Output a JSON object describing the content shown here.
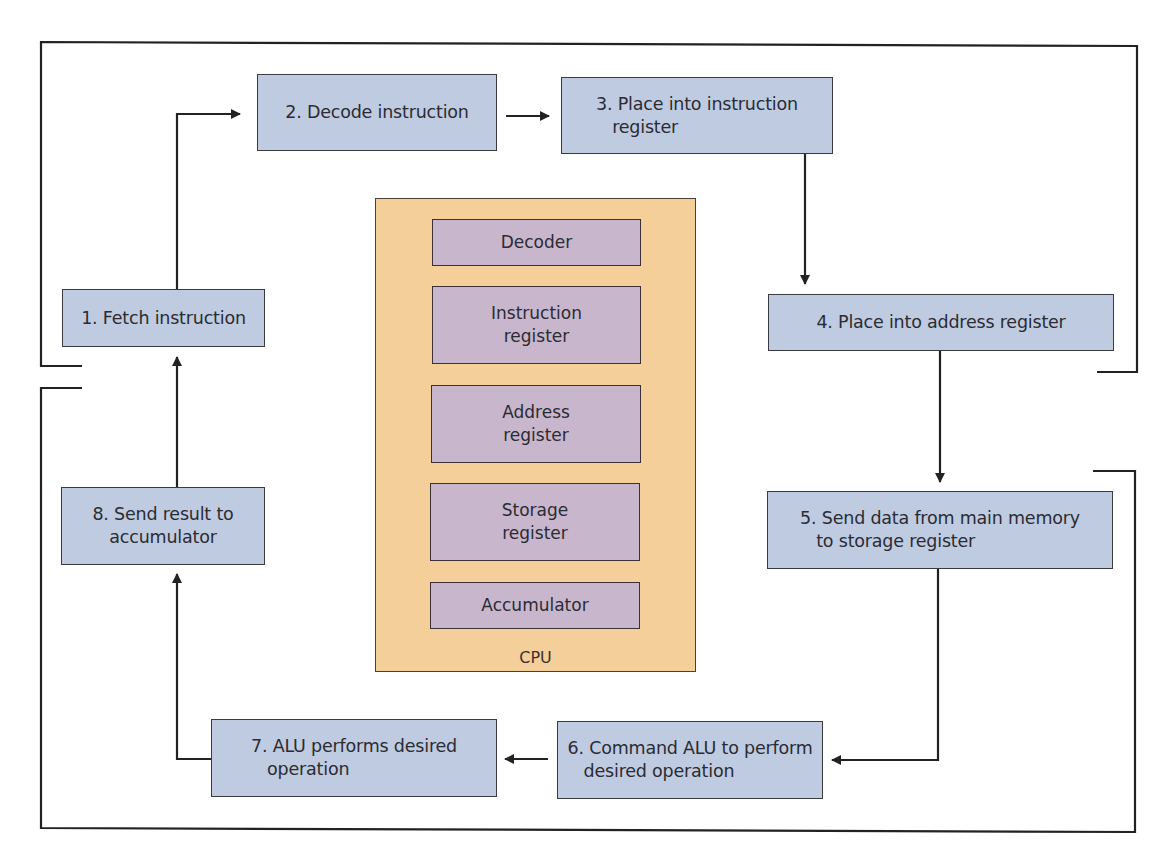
{
  "diagram": {
    "type": "flow-cycle",
    "colors": {
      "step_fill": "#bfcbe0",
      "cpu_fill": "#f5cf9a",
      "register_fill": "#c8b6cc",
      "line": "#222222",
      "background": "#ffffff"
    },
    "steps": [
      {
        "id": 1,
        "label": "1. Fetch instruction"
      },
      {
        "id": 2,
        "label": "2. Decode instruction"
      },
      {
        "id": 3,
        "label": "3. Place into instruction\n   register"
      },
      {
        "id": 4,
        "label": "4. Place into address register"
      },
      {
        "id": 5,
        "label": "5. Send data from main memory\n   to storage register"
      },
      {
        "id": 6,
        "label": "6. Command ALU to perform\n   desired operation"
      },
      {
        "id": 7,
        "label": "7. ALU performs desired\n   operation"
      },
      {
        "id": 8,
        "label": "8. Send result to\naccumulator"
      }
    ],
    "cpu": {
      "label": "CPU",
      "registers": [
        {
          "label": "Decoder"
        },
        {
          "label": "Instruction\nregister"
        },
        {
          "label": "Address\nregister"
        },
        {
          "label": "Storage\nregister"
        },
        {
          "label": "Accumulator"
        }
      ]
    },
    "edges": [
      {
        "from": 1,
        "to": 2
      },
      {
        "from": 2,
        "to": 3
      },
      {
        "from": 3,
        "to": 4
      },
      {
        "from": 4,
        "to": 5
      },
      {
        "from": 5,
        "to": 6
      },
      {
        "from": 6,
        "to": 7
      },
      {
        "from": 7,
        "to": 8
      },
      {
        "from": 8,
        "to": 1
      }
    ]
  }
}
